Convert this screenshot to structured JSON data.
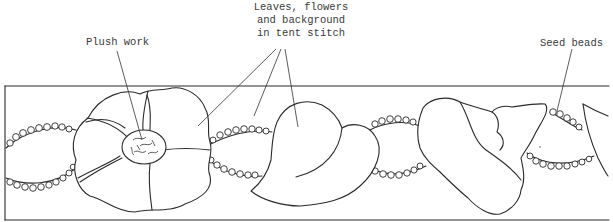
{
  "diagram": {
    "labels": {
      "plush_work": "Plush work",
      "leaves_line1": "Leaves, flowers",
      "leaves_line2": "and background",
      "leaves_line3": "in tent stitch",
      "seed_beads": "Seed beads"
    },
    "colors": {
      "ink": "#2a2a2a",
      "background": "#ffffff",
      "label_text": "#3a3a3a"
    }
  }
}
